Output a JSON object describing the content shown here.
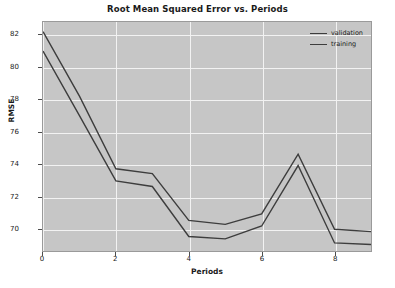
{
  "chart_data": {
    "type": "line",
    "title": "Root Mean Squared Error vs. Periods",
    "xlabel": "Periods",
    "ylabel": "RMSE",
    "x": [
      0,
      1,
      2,
      3,
      4,
      5,
      6,
      7,
      8,
      9
    ],
    "xlim": [
      0,
      9
    ],
    "ylim": [
      68.6,
      82.8
    ],
    "xticks": [
      0,
      2,
      4,
      6,
      8
    ],
    "xtick_labels": [
      "0",
      "2",
      "4",
      "6",
      "8"
    ],
    "yticks": [
      70,
      72,
      74,
      76,
      78,
      80,
      82
    ],
    "ytick_labels": [
      "70",
      "72",
      "74",
      "76",
      "78",
      "80",
      "82"
    ],
    "grid": true,
    "legend_position": "upper right",
    "series": [
      {
        "name": "training",
        "color": "#3d3d3d",
        "values": [
          81.0,
          77.0,
          72.95,
          72.6,
          69.5,
          69.35,
          70.15,
          73.9,
          69.1,
          69.0
        ]
      },
      {
        "name": "validation",
        "color": "#3d3d3d",
        "values": [
          82.2,
          78.2,
          73.7,
          73.4,
          70.5,
          70.25,
          70.9,
          74.6,
          69.95,
          69.8
        ]
      }
    ]
  },
  "figure": {
    "background": "#ffffff",
    "axes_background": "#c6c6c6",
    "gridline_color": "#f2f2f2"
  }
}
